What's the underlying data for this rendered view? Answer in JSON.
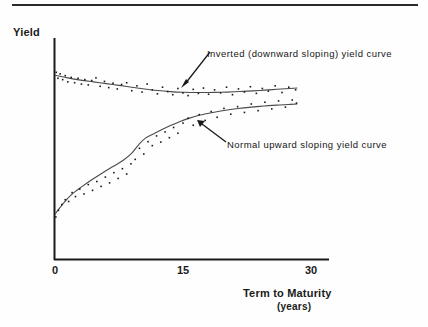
{
  "figure": {
    "top_rule": true,
    "background_color": "#fefefe",
    "ink_color": "#1a1a1a"
  },
  "labels": {
    "y_axis_title": "Yield",
    "x_axis_title": "Term to Maturity",
    "x_axis_units": "(years)"
  },
  "annotations": {
    "inverted": "Inverted (downward sloping) yield curve",
    "normal": "Normal upward sloping yield curve"
  },
  "chart_data": {
    "type": "scatter",
    "title": "",
    "subtitle": "",
    "xlabel": "Term to Maturity (years)",
    "ylabel": "Yield",
    "xlim": [
      0,
      30
    ],
    "ylim": [
      0,
      10
    ],
    "xticks": [
      0,
      15,
      30
    ],
    "xticklabels": [
      "0",
      "15",
      "30"
    ],
    "yticks": [],
    "yticklabels": [],
    "grid": false,
    "legend": "none",
    "axis_style": "left-and-bottom-spines",
    "annotations": [
      {
        "text": "Inverted (downward sloping) yield curve",
        "text_xy": [
          13.6,
          9.05
        ],
        "arrow_to": [
          11.0,
          6.45
        ],
        "arrow_from": [
          13.2,
          8.75
        ]
      },
      {
        "text": "Normal upward sloping yield curve",
        "text_xy": [
          15.4,
          5.25
        ],
        "arrow_to": [
          12.0,
          6.25
        ],
        "arrow_from": [
          14.9,
          5.05
        ]
      }
    ],
    "series": [
      {
        "name": "Inverted (downward sloping) yield curve",
        "kind": "scatter-with-fitted-line",
        "marker": "point",
        "marker_color": "#1a1a1a",
        "line_color": "#4a4a4a",
        "fit_x": [
          0.0,
          1.5,
          3.0,
          4.5,
          6.0,
          7.5,
          9.0,
          10.5,
          12.0,
          13.5,
          15.0,
          16.5,
          18.0,
          19.5,
          21.0,
          22.5,
          24.0,
          25.5,
          27.0,
          28.4
        ],
        "fit_y": [
          8.32,
          8.2,
          8.1,
          8.02,
          7.94,
          7.86,
          7.78,
          7.7,
          7.63,
          7.58,
          7.55,
          7.54,
          7.54,
          7.55,
          7.57,
          7.6,
          7.63,
          7.67,
          7.71,
          7.74
        ],
        "points_x": [
          0.15,
          0.35,
          0.6,
          0.9,
          1.2,
          1.5,
          1.9,
          2.3,
          2.7,
          3.1,
          3.5,
          3.9,
          4.3,
          4.8,
          5.3,
          5.8,
          6.3,
          6.8,
          7.3,
          7.8,
          8.4,
          9.0,
          9.6,
          10.2,
          10.8,
          11.4,
          12.0,
          12.6,
          13.2,
          13.8,
          14.4,
          15.0,
          15.6,
          16.2,
          16.8,
          17.4,
          18.0,
          18.7,
          19.4,
          20.1,
          20.8,
          21.5,
          22.2,
          22.9,
          23.6,
          24.3,
          25.0,
          25.8,
          26.6,
          27.4,
          28.2
        ],
        "points_y": [
          8.45,
          8.18,
          8.38,
          8.12,
          8.3,
          8.02,
          8.22,
          7.98,
          8.18,
          7.92,
          8.12,
          7.88,
          8.08,
          8.2,
          7.82,
          8.04,
          7.76,
          7.96,
          7.7,
          7.9,
          7.98,
          7.62,
          7.84,
          7.56,
          7.92,
          7.66,
          7.48,
          7.78,
          7.58,
          7.44,
          7.72,
          7.52,
          7.4,
          7.68,
          7.5,
          7.74,
          7.46,
          7.66,
          7.52,
          7.78,
          7.44,
          7.7,
          7.56,
          7.8,
          7.5,
          7.72,
          7.6,
          7.84,
          7.54,
          7.78,
          7.66
        ]
      },
      {
        "name": "Normal upward sloping yield curve",
        "kind": "scatter-with-fitted-line",
        "marker": "point",
        "marker_color": "#1a1a1a",
        "line_color": "#4a4a4a",
        "fit_x": [
          0.0,
          1.0,
          2.0,
          3.2,
          4.4,
          5.6,
          6.8,
          8.0,
          9.0,
          9.8,
          10.6,
          11.6,
          12.6,
          13.6,
          14.6,
          15.6,
          17.0,
          18.5,
          20.0,
          21.5,
          23.0,
          24.5,
          26.0,
          27.4,
          28.4
        ],
        "fit_y": [
          2.05,
          2.55,
          2.95,
          3.3,
          3.62,
          3.92,
          4.2,
          4.48,
          4.8,
          5.18,
          5.48,
          5.68,
          5.88,
          6.06,
          6.22,
          6.36,
          6.52,
          6.64,
          6.74,
          6.82,
          6.88,
          6.93,
          6.97,
          7.0,
          7.02
        ],
        "points_x": [
          0.1,
          0.4,
          0.8,
          1.2,
          1.6,
          2.0,
          2.4,
          2.9,
          3.4,
          3.9,
          4.4,
          4.9,
          5.4,
          5.9,
          6.4,
          6.9,
          7.4,
          7.9,
          8.4,
          8.9,
          9.4,
          9.9,
          10.4,
          10.9,
          11.4,
          11.9,
          12.4,
          12.9,
          13.4,
          13.9,
          14.4,
          15.0,
          15.6,
          16.2,
          16.9,
          17.6,
          18.3,
          19.0,
          19.8,
          20.6,
          21.4,
          22.2,
          23.0,
          23.8,
          24.6,
          25.4,
          26.2,
          27.0,
          27.8,
          28.3
        ],
        "points_y": [
          1.92,
          2.22,
          2.48,
          2.7,
          2.62,
          3.02,
          2.84,
          3.18,
          2.96,
          3.38,
          3.12,
          3.52,
          3.3,
          3.72,
          3.46,
          3.92,
          3.66,
          4.1,
          3.86,
          4.32,
          4.52,
          5.02,
          4.76,
          5.32,
          5.14,
          5.58,
          5.3,
          5.76,
          5.5,
          5.96,
          5.7,
          6.16,
          6.38,
          6.06,
          6.54,
          6.28,
          6.68,
          6.42,
          6.82,
          6.56,
          6.9,
          6.64,
          7.02,
          6.72,
          7.1,
          6.8,
          7.16,
          6.88,
          7.2,
          7.06
        ]
      }
    ]
  }
}
